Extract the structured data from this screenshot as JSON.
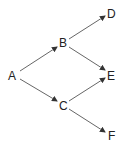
{
  "diagram": {
    "type": "directed-tree",
    "nodes": [
      {
        "id": "A",
        "label": "A",
        "x": 12,
        "y": 76
      },
      {
        "id": "B",
        "label": "B",
        "x": 63,
        "y": 43
      },
      {
        "id": "C",
        "label": "C",
        "x": 63,
        "y": 106
      },
      {
        "id": "D",
        "label": "D",
        "x": 111,
        "y": 13
      },
      {
        "id": "E",
        "label": "E",
        "x": 111,
        "y": 75
      },
      {
        "id": "F",
        "label": "F",
        "x": 111,
        "y": 136
      }
    ],
    "edges": [
      {
        "from": "A",
        "to": "B"
      },
      {
        "from": "A",
        "to": "C"
      },
      {
        "from": "B",
        "to": "D"
      },
      {
        "from": "B",
        "to": "E"
      },
      {
        "from": "C",
        "to": "E"
      },
      {
        "from": "C",
        "to": "F"
      }
    ],
    "colors": {
      "line": "#555555",
      "text": "#222222",
      "background": "#ffffff"
    }
  }
}
